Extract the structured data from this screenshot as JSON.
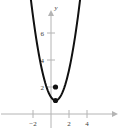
{
  "chart_data": {
    "type": "line",
    "title": "",
    "xlabel": "",
    "ylabel": "y",
    "xlim": [
      -2.9,
      5.4
    ],
    "ylim": [
      -0.55,
      7.1
    ],
    "grid": false,
    "legend": null,
    "x_ticks": [
      -2,
      2,
      4
    ],
    "x_tick_labels": [
      "−2",
      "2",
      "4"
    ],
    "y_ticks": [
      2,
      4,
      6
    ],
    "y_tick_labels": [
      "2",
      "4",
      "6"
    ],
    "series": [
      {
        "name": "parabola",
        "type": "line",
        "equation": "y = (x - 0.5)^2 + 1",
        "color": "#111111",
        "x_start": -2.85,
        "x_end": 5.2,
        "vertex": [
          0.5,
          1
        ]
      },
      {
        "name": "points",
        "type": "scatter",
        "color": "#111111",
        "points": [
          {
            "x": 0.5,
            "y": 2
          },
          {
            "x": 0.5,
            "y": 1
          }
        ]
      }
    ]
  },
  "axes": {
    "y_axis_label": "y",
    "axis_color": "#b4b4b4",
    "curve_color": "#111111",
    "point_color": "#111111",
    "background": "#ffffff"
  },
  "geometry": {
    "origin_x_px": 51,
    "origin_y_px": 114,
    "px_per_unit_x": 9,
    "px_per_unit_y": 13.5
  }
}
